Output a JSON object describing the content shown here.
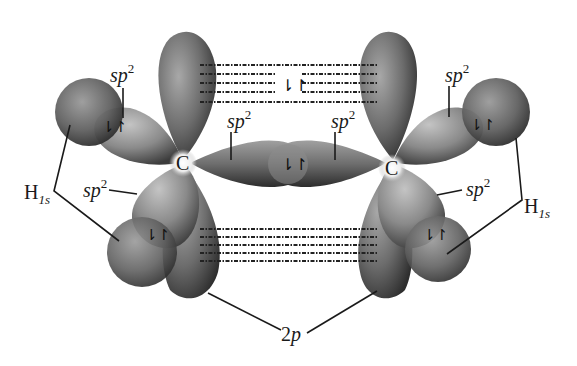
{
  "atoms": {
    "left_carbon": "C",
    "right_carbon": "C"
  },
  "labels": {
    "sp2_upper_left": "sp",
    "sp2_upper_left_sup": "2",
    "sp2_center_left": "sp",
    "sp2_center_left_sup": "2",
    "sp2_center_right": "sp",
    "sp2_center_right_sup": "2",
    "sp2_upper_right": "sp",
    "sp2_upper_right_sup": "2",
    "sp2_lower_left": "sp",
    "sp2_lower_left_sup": "2",
    "sp2_lower_right": "sp",
    "sp2_lower_right_sup": "2",
    "h1s_left": "H",
    "h1s_left_sub": "1s",
    "h1s_right": "H",
    "h1s_right_sub": "1s",
    "two_p": "2",
    "two_p_italic": "p"
  },
  "electron_pairs": {
    "symbol": "⇂↾",
    "locations": [
      "pi-top",
      "sigma-CC",
      "CH-upper-left",
      "CH-lower-left",
      "CH-upper-right",
      "CH-lower-right"
    ]
  },
  "colors": {
    "orbital_dark": "#3a3a3a",
    "orbital_mid": "#7a7a7a",
    "orbital_light": "#b8b8b8",
    "background": "#ffffff",
    "text": "#1a1a1a"
  }
}
